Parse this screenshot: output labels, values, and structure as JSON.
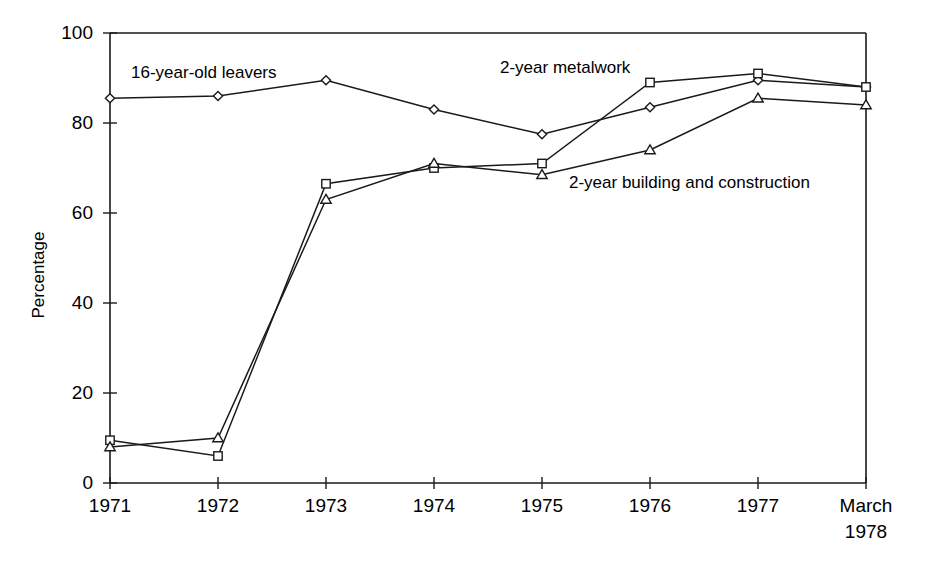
{
  "chart_data": {
    "type": "line",
    "title": "",
    "subtitle": "",
    "xlabel": "",
    "ylabel": "Percentage",
    "ylim": [
      0,
      100
    ],
    "yticks": [
      0,
      20,
      40,
      60,
      80,
      100
    ],
    "ytick_labels": [
      "0",
      "20",
      "40",
      "60",
      "80",
      "100"
    ],
    "grid": false,
    "legend_position": "inline-annotations",
    "categories": [
      "1971",
      "1972",
      "1973",
      "1974",
      "1975",
      "1976",
      "1977",
      "March 1978"
    ],
    "xtick_labels": [
      {
        "line1": "1971",
        "line2": ""
      },
      {
        "line1": "1972",
        "line2": ""
      },
      {
        "line1": "1973",
        "line2": ""
      },
      {
        "line1": "1974",
        "line2": ""
      },
      {
        "line1": "1975",
        "line2": ""
      },
      {
        "line1": "1976",
        "line2": ""
      },
      {
        "line1": "1977",
        "line2": ""
      },
      {
        "line1": "March",
        "line2": "1978"
      }
    ],
    "series": [
      {
        "name": "16-year-old leavers",
        "marker": "diamond",
        "color": "#1a1a1a",
        "values": [
          85.5,
          86.0,
          89.5,
          83.0,
          77.5,
          83.5,
          89.5,
          88.0
        ]
      },
      {
        "name": "2-year metalwork",
        "marker": "square",
        "color": "#1a1a1a",
        "values": [
          9.5,
          6.0,
          66.5,
          70.0,
          71.0,
          89.0,
          91.0,
          88.0
        ]
      },
      {
        "name": "2-year building and construction",
        "marker": "triangle",
        "color": "#1a1a1a",
        "values": [
          8.0,
          10.0,
          63.0,
          71.0,
          68.5,
          74.0,
          85.5,
          84.0
        ]
      }
    ],
    "annotations": [
      {
        "text": "16-year-old leavers",
        "x_px": 131,
        "y_px": 78,
        "series": "16-year-old leavers"
      },
      {
        "text": "2-year metalwork",
        "x_px": 500,
        "y_px": 73,
        "series": "2-year metalwork"
      },
      {
        "text": "2-year building and construction",
        "x_px": 569,
        "y_px": 188,
        "series": "2-year building and construction"
      }
    ]
  },
  "axis": {
    "y_axis_title": "Percentage"
  }
}
